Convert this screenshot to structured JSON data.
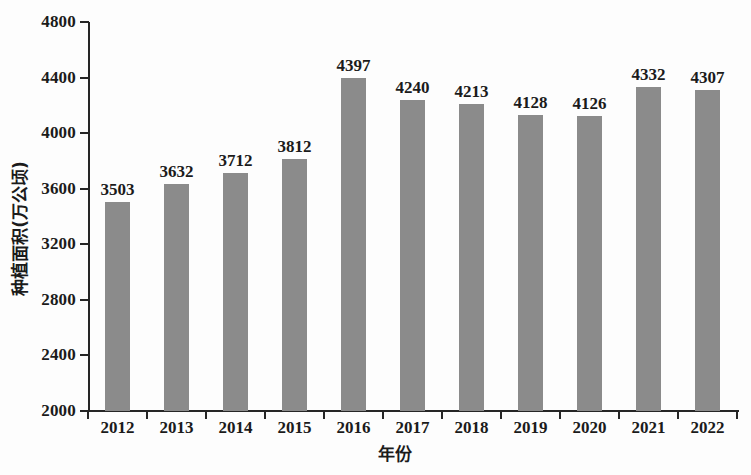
{
  "chart_data": {
    "type": "bar",
    "title": "",
    "xlabel": "年份",
    "ylabel": "种植面积(万公顷)",
    "categories": [
      "2012",
      "2013",
      "2014",
      "2015",
      "2016",
      "2017",
      "2018",
      "2019",
      "2020",
      "2021",
      "2022"
    ],
    "values": [
      3503,
      3632,
      3712,
      3812,
      4397,
      4240,
      4213,
      4128,
      4126,
      4332,
      4307
    ],
    "data_labels": [
      "3503",
      "3632",
      "3712",
      "3812",
      "4397",
      "4240",
      "4213",
      "4128",
      "4126",
      "4332",
      "4307"
    ],
    "ylim": [
      2000,
      4800
    ],
    "ytick_values": [
      2000,
      2400,
      2800,
      3200,
      3600,
      4000,
      4400,
      4800
    ],
    "ytick_labels": [
      "2000",
      "2400",
      "2800",
      "3200",
      "3600",
      "4000",
      "4400",
      "4800"
    ],
    "grid": false,
    "legend": false,
    "bar_color": "#8b8b8b",
    "axis_color": "#262626",
    "text_color": "#1b1b1b",
    "background": "#fdfdfd"
  }
}
